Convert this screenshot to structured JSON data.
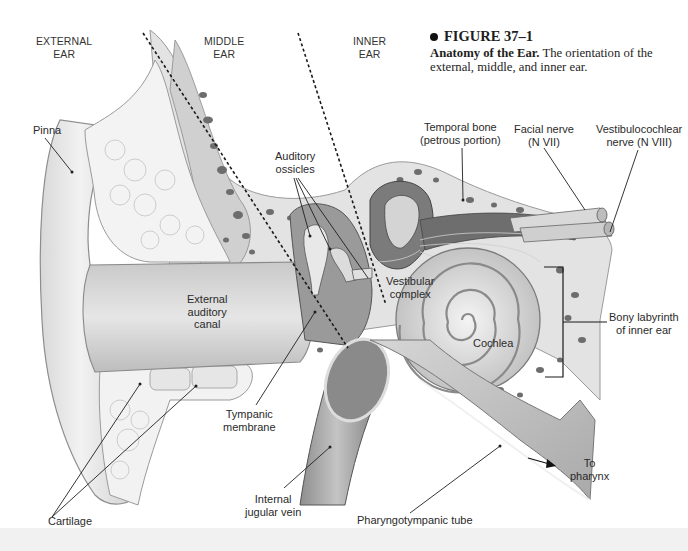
{
  "figure": {
    "number_label": "FIGURE 37–1",
    "title": "Anatomy of the Ear.",
    "description": "The orientation of the external, middle, and inner ear."
  },
  "regions": {
    "external": "EXTERNAL\nEAR",
    "middle": "MIDDLE\nEAR",
    "inner": "INNER\nEAR"
  },
  "labels": {
    "pinna": "Pinna",
    "temporal_bone": "Temporal bone\n(petrous portion)",
    "facial_nerve": "Facial nerve\n(N VII)",
    "vestibulocochlear_nerve": "Vestibulocochlear\nnerve (N VIII)",
    "auditory_ossicles": "Auditory\nossicles",
    "vestibular_complex": "Vestibular\ncomplex",
    "external_auditory_canal": "External\nauditory\ncanal",
    "cochlea": "Cochlea",
    "bony_labyrinth": "Bony labyrinth\nof inner ear",
    "tympanic_membrane": "Tympanic\nmembrane",
    "internal_jugular_vein": "Internal\njugular vein",
    "pharyngotympanic_tube": "Pharyngotympanic tube",
    "to_pharynx": "To\npharynx",
    "cartilage": "Cartilage"
  },
  "colors": {
    "background": "#ffffff",
    "tissue_light": "#e9e9e9",
    "tissue_mid": "#cfcfcf",
    "tissue_dark": "#8c8c8c",
    "bone_pore": "#6a6a6a",
    "leader_line": "#222222"
  }
}
